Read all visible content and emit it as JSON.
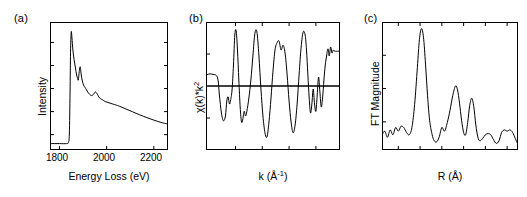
{
  "figure": {
    "panels": [
      {
        "label": "(a)",
        "xlabel": "Energy Loss (eV)",
        "ylabel": "Intensity",
        "xticks": [
          "1800",
          "2000",
          "2200"
        ]
      },
      {
        "label": "(b)",
        "xlabel_base": "k (Å",
        "xlabel_sup": "-1",
        "xlabel_close": ")",
        "ylabel_base": "χ(k)*k",
        "ylabel_sup": "2",
        "xticks": [
          "",
          "",
          "",
          ""
        ]
      },
      {
        "label": "(c)",
        "xlabel": "R (Å)",
        "ylabel": "FT Magnitude",
        "xticks": [
          "",
          "",
          "",
          "",
          "",
          ""
        ]
      }
    ]
  },
  "chart_data": [
    {
      "type": "line",
      "panel": "(a)",
      "title": "",
      "xlabel": "Energy Loss (eV)",
      "ylabel": "Intensity",
      "xlim": [
        1760,
        2260
      ],
      "ylim": [
        0,
        1
      ],
      "grid": false,
      "legend": null,
      "xtick_values": [
        1800,
        2000,
        2200
      ],
      "ytick_values": [
        0.12,
        0.3,
        0.48,
        0.66,
        0.84
      ],
      "ytick_labels": [],
      "description": "EELS core-loss edge: flat pre-edge baseline, sharp white-line onset near 1845 eV, then monotonic decay with fine-structure shoulders",
      "x": [
        1760,
        1800,
        1830,
        1838,
        1842,
        1845,
        1847,
        1850,
        1853,
        1857,
        1862,
        1868,
        1872,
        1876,
        1880,
        1884,
        1888,
        1892,
        1896,
        1900,
        1904,
        1908,
        1914,
        1920,
        1928,
        1936,
        1944,
        1952,
        1958,
        1964,
        1970,
        1978,
        1986,
        1994,
        2002,
        2010,
        2018,
        2026,
        2034,
        2042,
        2050,
        2062,
        2074,
        2086,
        2098,
        2110,
        2125,
        2140,
        2155,
        2170,
        2185,
        2200,
        2215,
        2230,
        2245,
        2255
      ],
      "y": [
        0.02,
        0.02,
        0.02,
        0.03,
        0.1,
        0.45,
        0.78,
        0.95,
        0.9,
        0.8,
        0.72,
        0.65,
        0.6,
        0.57,
        0.55,
        0.62,
        0.66,
        0.6,
        0.55,
        0.52,
        0.5,
        0.49,
        0.47,
        0.45,
        0.43,
        0.42,
        0.43,
        0.45,
        0.44,
        0.42,
        0.4,
        0.39,
        0.38,
        0.37,
        0.365,
        0.36,
        0.355,
        0.35,
        0.345,
        0.34,
        0.335,
        0.325,
        0.315,
        0.305,
        0.295,
        0.285,
        0.272,
        0.26,
        0.248,
        0.237,
        0.226,
        0.216,
        0.206,
        0.197,
        0.189,
        0.185
      ]
    },
    {
      "type": "line",
      "panel": "(b)",
      "title": "",
      "xlabel": "k (Å⁻¹)",
      "ylabel": "χ(k)*k²",
      "xlim": [
        0,
        1
      ],
      "ylim": [
        -1,
        1
      ],
      "grid": false,
      "legend": null,
      "zero_line": 0,
      "description": "k-squared weighted EXAFS oscillations about a zero baseline; amplitude grows then becomes noisy at high k, flat segment at right edge",
      "x": [
        0,
        0.02,
        0.04,
        0.06,
        0.075,
        0.09,
        0.1,
        0.115,
        0.13,
        0.145,
        0.155,
        0.165,
        0.175,
        0.185,
        0.195,
        0.205,
        0.215,
        0.225,
        0.235,
        0.245,
        0.255,
        0.265,
        0.275,
        0.285,
        0.295,
        0.305,
        0.32,
        0.335,
        0.35,
        0.365,
        0.38,
        0.395,
        0.41,
        0.425,
        0.44,
        0.455,
        0.47,
        0.485,
        0.5,
        0.515,
        0.53,
        0.545,
        0.56,
        0.575,
        0.59,
        0.605,
        0.62,
        0.635,
        0.65,
        0.665,
        0.68,
        0.695,
        0.71,
        0.725,
        0.74,
        0.75,
        0.76,
        0.77,
        0.78,
        0.79,
        0.8,
        0.81,
        0.82,
        0.83,
        0.84,
        0.85,
        0.86,
        0.87,
        0.88,
        0.89,
        0.9,
        0.91,
        0.92,
        0.93,
        0.94,
        0.95,
        0.96,
        0.97,
        0.98,
        1
      ],
      "y": [
        0.18,
        0.2,
        0.2,
        0.19,
        0.18,
        0.1,
        -0.15,
        -0.45,
        -0.58,
        -0.5,
        -0.25,
        -0.18,
        -0.3,
        -0.22,
        -0.05,
        0.35,
        0.85,
        0.92,
        0.6,
        0.1,
        -0.35,
        -0.6,
        -0.55,
        -0.42,
        -0.5,
        -0.42,
        -0.2,
        0.1,
        0.5,
        0.88,
        0.9,
        0.5,
        -0.05,
        -0.5,
        -0.78,
        -0.85,
        -0.6,
        -0.2,
        0.25,
        0.6,
        0.72,
        0.75,
        0.6,
        0.68,
        0.55,
        0.2,
        -0.25,
        -0.6,
        -0.78,
        -0.65,
        -0.3,
        0.2,
        0.65,
        0.9,
        0.85,
        0.6,
        0.2,
        -0.2,
        -0.45,
        -0.3,
        -0.05,
        -0.3,
        -0.42,
        -0.15,
        0.15,
        -0.1,
        -0.35,
        -0.2,
        0.1,
        0.35,
        0.5,
        0.62,
        0.5,
        0.65,
        0.55,
        0.6,
        0.58,
        0.58,
        0.58,
        0.58
      ]
    },
    {
      "type": "line",
      "panel": "(c)",
      "title": "",
      "xlabel": "R (Å)",
      "ylabel": "FT Magnitude",
      "xlim": [
        0,
        1
      ],
      "ylim": [
        0,
        1
      ],
      "grid": false,
      "legend": null,
      "description": "Fourier transform magnitude: dominant first-shell peak, two smaller outer-shell peaks, low-amplitude ripples beyond",
      "x": [
        0,
        0.02,
        0.04,
        0.06,
        0.08,
        0.1,
        0.12,
        0.14,
        0.16,
        0.18,
        0.2,
        0.22,
        0.24,
        0.26,
        0.275,
        0.29,
        0.305,
        0.32,
        0.335,
        0.35,
        0.365,
        0.38,
        0.4,
        0.42,
        0.44,
        0.46,
        0.48,
        0.5,
        0.52,
        0.54,
        0.555,
        0.57,
        0.585,
        0.6,
        0.615,
        0.63,
        0.645,
        0.66,
        0.675,
        0.69,
        0.705,
        0.72,
        0.74,
        0.76,
        0.78,
        0.8,
        0.82,
        0.84,
        0.86,
        0.88,
        0.9,
        0.92,
        0.94,
        0.96,
        0.98,
        1
      ],
      "y": [
        0.1,
        0.13,
        0.08,
        0.14,
        0.1,
        0.16,
        0.13,
        0.17,
        0.16,
        0.12,
        0.1,
        0.16,
        0.35,
        0.65,
        0.88,
        0.97,
        0.9,
        0.68,
        0.42,
        0.22,
        0.12,
        0.06,
        0.04,
        0.08,
        0.16,
        0.13,
        0.2,
        0.3,
        0.42,
        0.5,
        0.47,
        0.36,
        0.22,
        0.12,
        0.1,
        0.2,
        0.34,
        0.4,
        0.33,
        0.18,
        0.08,
        0.05,
        0.07,
        0.1,
        0.11,
        0.1,
        0.06,
        0.03,
        0.05,
        0.12,
        0.14,
        0.13,
        0.14,
        0.12,
        0.07,
        0.02
      ]
    }
  ]
}
